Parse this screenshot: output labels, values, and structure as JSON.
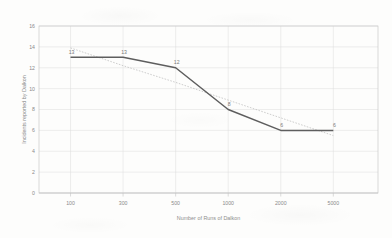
{
  "chart_data": {
    "type": "line",
    "title": "",
    "xlabel": "Number of Runs of Dalkon",
    "ylabel": "Incidents reported by Dalkon",
    "categories": [
      "100",
      "300",
      "500",
      "1000",
      "2000",
      "5000"
    ],
    "values": [
      13,
      13,
      12,
      8,
      6,
      6
    ],
    "point_labels": [
      "13",
      "13",
      "12",
      "8",
      "6",
      "6"
    ],
    "ylim": [
      0,
      16
    ],
    "ytick_labels": [
      "0",
      "2",
      "4",
      "6",
      "8",
      "10",
      "12",
      "14",
      "16"
    ],
    "ytick_values": [
      0,
      2,
      4,
      6,
      8,
      10,
      12,
      14,
      16
    ],
    "grid": true,
    "legend": "none",
    "series": [
      {
        "name": "Incidents reported by Dalkon",
        "values": [
          13,
          13,
          12,
          8,
          6,
          6
        ],
        "color": "#5e5e5e",
        "style": "solid"
      },
      {
        "name": "Linear trendline",
        "values": [
          13.9,
          12.2,
          10.6,
          8.9,
          7.2,
          5.5
        ],
        "color": "#b9b9b9",
        "style": "dotted"
      }
    ],
    "colors": {
      "series": "#5e5e5e",
      "trendline": "#b9b9b9",
      "grid": "#dcdcdc",
      "axis": "#c4c4c4",
      "text": "#8a8a8a",
      "background": "#fdfdfc"
    }
  }
}
